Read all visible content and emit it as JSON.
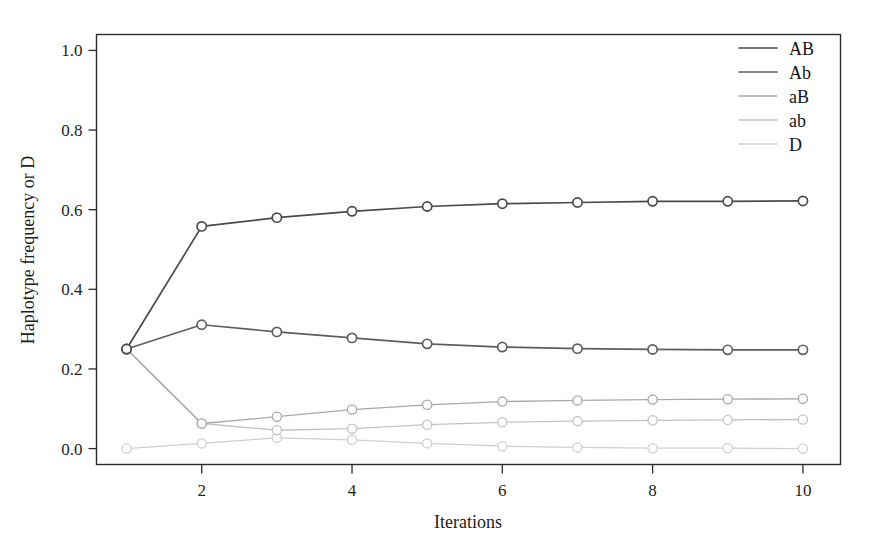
{
  "chart_data": {
    "type": "line",
    "title": "",
    "xlabel": "Iterations",
    "ylabel": "Haplotype frequency or D",
    "x": [
      1,
      2,
      3,
      4,
      5,
      6,
      7,
      8,
      9,
      10
    ],
    "xlim": [
      0.6,
      10.5
    ],
    "ylim": [
      -0.04,
      1.04
    ],
    "xticks": [
      2,
      4,
      6,
      8,
      10
    ],
    "xtick_labels": [
      "2",
      "4",
      "6",
      "8",
      "10"
    ],
    "yticks": [
      0.0,
      0.2,
      0.4,
      0.6,
      0.8,
      1.0
    ],
    "ytick_labels": [
      "0.0",
      "0.2",
      "0.4",
      "0.6",
      "0.8",
      "1.0"
    ],
    "grid": false,
    "legend_position": "top-right",
    "marker": "open-circle",
    "series": [
      {
        "name": "AB",
        "color": "#4a4a4a",
        "values": [
          0.25,
          0.558,
          0.58,
          0.596,
          0.608,
          0.615,
          0.618,
          0.621,
          0.621,
          0.622
        ]
      },
      {
        "name": "Ab",
        "color": "#5e5e5e",
        "values": [
          0.25,
          0.311,
          0.293,
          0.278,
          0.263,
          0.255,
          0.251,
          0.249,
          0.248,
          0.248
        ]
      },
      {
        "name": "aB",
        "color": "#a8a8a8",
        "values": [
          0.25,
          0.063,
          0.08,
          0.098,
          0.11,
          0.118,
          0.121,
          0.123,
          0.124,
          0.125
        ]
      },
      {
        "name": "ab",
        "color": "#c2c2c2",
        "values": [
          0.25,
          0.063,
          0.046,
          0.05,
          0.06,
          0.066,
          0.069,
          0.071,
          0.072,
          0.073
        ]
      },
      {
        "name": "D",
        "color": "#cfcfcf",
        "values": [
          0.0,
          0.013,
          0.027,
          0.022,
          0.013,
          0.006,
          0.003,
          0.001,
          0.001,
          0.0
        ]
      }
    ]
  },
  "legend": {
    "entries": [
      {
        "label": "AB",
        "color": "#4a4a4a"
      },
      {
        "label": "Ab",
        "color": "#5e5e5e"
      },
      {
        "label": "aB",
        "color": "#a8a8a8"
      },
      {
        "label": "ab",
        "color": "#c2c2c2"
      },
      {
        "label": "D",
        "color": "#cfcfcf"
      }
    ]
  },
  "axes": {
    "x_title": "Iterations",
    "y_title": "Haplotype frequency or D"
  },
  "style": {
    "frame_color": "#2b2b2b",
    "background": "#ffffff",
    "marker_fill": "#ffffff"
  }
}
